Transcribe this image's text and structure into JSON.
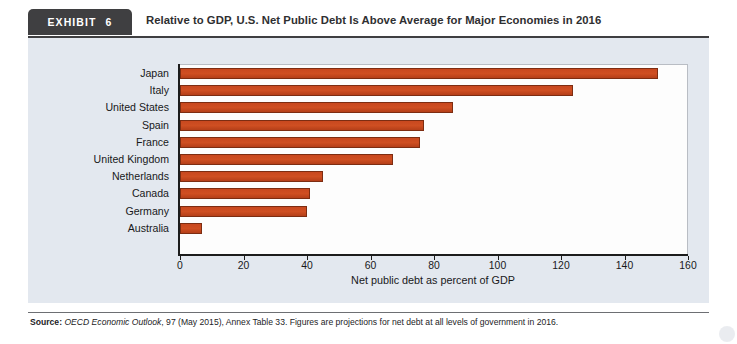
{
  "exhibit": {
    "badge_word": "EXHIBIT",
    "badge_number": "6",
    "title": "Relative to GDP, U.S. Net Public Debt Is Above Average for Major Economies in 2016"
  },
  "source": {
    "label": "Source:",
    "publication": "OECD Economic Outlook",
    "rest": ", 97 (May 2015), Annex Table 33. Figures are projections for net debt at all levels of government in 2016."
  },
  "chart_data": {
    "type": "bar",
    "orientation": "horizontal",
    "title": "Relative to GDP, U.S. Net Public Debt Is Above Average for Major Economies in 2016",
    "xlabel": "Net public debt as percent of GDP",
    "ylabel": "",
    "xlim": [
      0,
      160
    ],
    "xticks": [
      0,
      20,
      40,
      60,
      80,
      100,
      120,
      140,
      160
    ],
    "grid": false,
    "legend": false,
    "bar_color": "#c8481f",
    "bar_border_color": "#7d2d12",
    "categories": [
      "Japan",
      "Italy",
      "United States",
      "Spain",
      "France",
      "United Kingdom",
      "Netherlands",
      "Canada",
      "Germany",
      "Australia"
    ],
    "values": [
      150.7,
      123.7,
      86.0,
      77.0,
      75.7,
      67.0,
      45.0,
      41.0,
      40.0,
      7.0
    ]
  }
}
